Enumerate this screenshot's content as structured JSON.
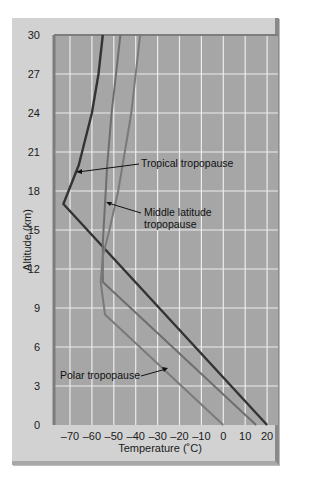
{
  "chart_data": {
    "type": "line",
    "title": "",
    "xlabel": "Temperature (°C)",
    "ylabel": "Altitude (km)",
    "xlim": [
      -75,
      25
    ],
    "ylim": [
      0,
      30
    ],
    "xticks": [
      -70,
      -60,
      -50,
      -40,
      -30,
      -20,
      -10,
      0,
      10,
      20
    ],
    "yticks": [
      0,
      3,
      6,
      9,
      12,
      15,
      18,
      21,
      24,
      27,
      30
    ],
    "grid": true,
    "legend": "none (inline annotations)",
    "series": [
      {
        "name": "Tropical",
        "color": "#333333",
        "points": [
          [
            20,
            0
          ],
          [
            -73,
            17
          ],
          [
            -66,
            20
          ],
          [
            -60,
            24
          ],
          [
            -57,
            27
          ],
          [
            -55,
            30
          ]
        ]
      },
      {
        "name": "Middle latitude",
        "color": "#6e6e6e",
        "points": [
          [
            15,
            0
          ],
          [
            -55,
            11
          ],
          [
            -55,
            14
          ],
          [
            -54,
            17
          ],
          [
            -53,
            20
          ],
          [
            -51,
            24
          ],
          [
            -49,
            27
          ],
          [
            -47,
            30
          ]
        ]
      },
      {
        "name": "Polar",
        "color": "#7a7a7a",
        "points": [
          [
            0,
            0
          ],
          [
            -54,
            8.5
          ],
          [
            -56,
            11
          ],
          [
            -55,
            13
          ],
          [
            -52,
            15
          ],
          [
            -48,
            18
          ],
          [
            -45,
            21
          ],
          [
            -42,
            24
          ],
          [
            -40,
            27
          ],
          [
            -38,
            30
          ]
        ]
      }
    ],
    "annotations": [
      {
        "text": "Tropical tropopause",
        "target": [
          -66,
          19.6
        ]
      },
      {
        "text": "Middle latitude tropopause",
        "target": [
          -55,
          17.5
        ]
      },
      {
        "text": "Polar tropopause",
        "target": [
          -40,
          4.7
        ]
      }
    ]
  },
  "labels": {
    "xlabel": "Temperature (˚C)",
    "ylabel": "Altitude (km)",
    "anno_tropical": "Tropical tropopause",
    "anno_mid_1": "Middle latitude",
    "anno_mid_2": "tropopause",
    "anno_polar": "Polar tropopause"
  }
}
